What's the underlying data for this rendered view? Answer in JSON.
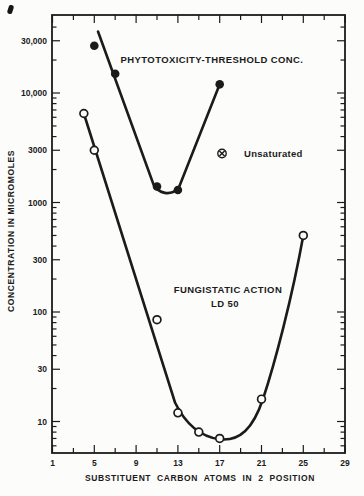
{
  "figure": {
    "background": "#fcfcfa",
    "ink_color": "#1b1b1b"
  },
  "chart_data": {
    "type": "scatter",
    "title": "",
    "xlabel": "SUBSTITUENT CARBON ATOMS IN 2 POSITION",
    "ylabel": "CONCENTRATION IN MICROMOLES",
    "x_axis": {
      "scale": "linear",
      "min": 1,
      "max": 29,
      "major_ticks": [
        1,
        5,
        9,
        13,
        17,
        21,
        25,
        29
      ],
      "minor_ticks": [
        3,
        7,
        11,
        15,
        19,
        23,
        27
      ],
      "tick_label_texts": [
        "1",
        "5",
        "9",
        "13",
        "17",
        "21",
        "25",
        "29"
      ]
    },
    "y_axis": {
      "scale": "log",
      "min": 5.5,
      "max": 50000,
      "labeled_ticks": [
        {
          "value": 10,
          "text": "10"
        },
        {
          "value": 30,
          "text": "30"
        },
        {
          "value": 100,
          "text": "100"
        },
        {
          "value": 300,
          "text": "300"
        },
        {
          "value": 1000,
          "text": "1000"
        },
        {
          "value": 3000,
          "text": "3000"
        },
        {
          "value": 10000,
          "text": "10,000"
        },
        {
          "value": 30000,
          "text": "30,000"
        }
      ]
    },
    "grid": false,
    "legend_position": "inside-right",
    "series": [
      {
        "name": "PHYTOTOXICITY-THRESHOLD CONC.",
        "marker": "filled-circle",
        "points": [
          [
            5,
            27000
          ],
          [
            7,
            15000
          ],
          [
            11,
            1400
          ],
          [
            13,
            1300
          ],
          [
            17,
            12000
          ]
        ]
      },
      {
        "name": "FUNGISTATIC ACTION LD 50",
        "marker": "open-circle",
        "points": [
          [
            4,
            6500
          ],
          [
            5,
            3000
          ],
          [
            11,
            85
          ],
          [
            13,
            12
          ],
          [
            15,
            8
          ],
          [
            17,
            7
          ],
          [
            21,
            16
          ],
          [
            25,
            500
          ]
        ]
      }
    ],
    "annotations": {
      "phytotoxicity_title": "PHYTOTOXICITY-THRESHOLD CONC.",
      "fungistatic_line1": "FUNGISTATIC ACTION",
      "fungistatic_line2": "LD 50",
      "legend": {
        "symbol": "circled-x-marker",
        "label": "Unsaturated"
      }
    }
  }
}
